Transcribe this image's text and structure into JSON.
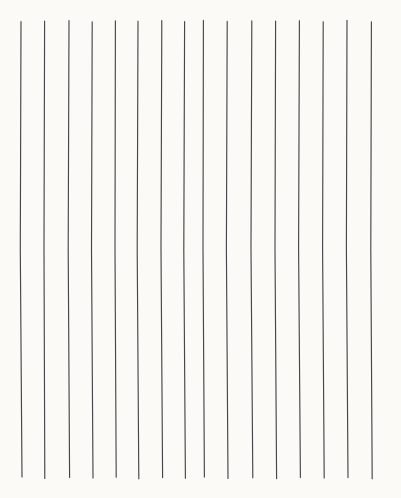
{
  "artwork": {
    "title": "Vertical Lines",
    "description": "Sixteen hand-drawn near-vertical lines on off-white paper",
    "medium": "pen-on-paper",
    "canvas": {
      "width": 401,
      "height": 498,
      "background_color": "#fbfaf7",
      "border_color": "#ffffff"
    },
    "stroke": {
      "color": "#3c3c3e",
      "width": 1.15,
      "linecap": "round",
      "opacity": 0.95
    },
    "line_count": 16,
    "extent": {
      "x_first": 21,
      "x_last": 372,
      "y_top": 20,
      "y_bottom": 478,
      "mean_spacing": 23.4
    },
    "lines": [
      {
        "id": 1,
        "x_top": 21.0,
        "x_mid": 20.3,
        "x_bottom": 22.0,
        "y_top": 21.5,
        "y_bottom": 477.0,
        "wobble": -0.7
      },
      {
        "id": 2,
        "x_top": 44.6,
        "x_mid": 44.0,
        "x_bottom": 44.8,
        "y_top": 21.0,
        "y_bottom": 478.5,
        "wobble": -0.5
      },
      {
        "id": 3,
        "x_top": 69.0,
        "x_mid": 68.2,
        "x_bottom": 69.6,
        "y_top": 20.5,
        "y_bottom": 477.5,
        "wobble": -0.8
      },
      {
        "id": 4,
        "x_top": 92.2,
        "x_mid": 91.5,
        "x_bottom": 93.0,
        "y_top": 21.8,
        "y_bottom": 478.0,
        "wobble": -0.6
      },
      {
        "id": 5,
        "x_top": 115.4,
        "x_mid": 115.0,
        "x_bottom": 116.2,
        "y_top": 20.8,
        "y_bottom": 477.2,
        "wobble": -0.4
      },
      {
        "id": 6,
        "x_top": 138.0,
        "x_mid": 137.2,
        "x_bottom": 138.8,
        "y_top": 21.2,
        "y_bottom": 478.8,
        "wobble": -0.7
      },
      {
        "id": 7,
        "x_top": 161.8,
        "x_mid": 161.0,
        "x_bottom": 162.6,
        "y_top": 20.6,
        "y_bottom": 477.6,
        "wobble": -0.8
      },
      {
        "id": 8,
        "x_top": 184.6,
        "x_mid": 183.8,
        "x_bottom": 185.4,
        "y_top": 21.6,
        "y_bottom": 478.2,
        "wobble": -0.6
      },
      {
        "id": 9,
        "x_top": 203.4,
        "x_mid": 203.0,
        "x_bottom": 204.4,
        "y_top": 20.4,
        "y_bottom": 477.0,
        "wobble": -0.4
      },
      {
        "id": 10,
        "x_top": 227.2,
        "x_mid": 226.4,
        "x_bottom": 228.0,
        "y_top": 21.4,
        "y_bottom": 478.4,
        "wobble": -0.7
      },
      {
        "id": 11,
        "x_top": 251.8,
        "x_mid": 251.0,
        "x_bottom": 252.8,
        "y_top": 20.9,
        "y_bottom": 477.8,
        "wobble": -0.8
      },
      {
        "id": 12,
        "x_top": 275.6,
        "x_mid": 275.0,
        "x_bottom": 276.6,
        "y_top": 21.1,
        "y_bottom": 478.6,
        "wobble": -0.5
      },
      {
        "id": 13,
        "x_top": 299.4,
        "x_mid": 298.6,
        "x_bottom": 300.4,
        "y_top": 20.7,
        "y_bottom": 477.4,
        "wobble": -0.8
      },
      {
        "id": 14,
        "x_top": 323.2,
        "x_mid": 322.6,
        "x_bottom": 324.2,
        "y_top": 21.7,
        "y_bottom": 478.0,
        "wobble": -0.6
      },
      {
        "id": 15,
        "x_top": 347.0,
        "x_mid": 346.4,
        "x_bottom": 348.0,
        "y_top": 20.3,
        "y_bottom": 477.6,
        "wobble": -0.6
      },
      {
        "id": 16,
        "x_top": 371.4,
        "x_mid": 370.8,
        "x_bottom": 372.2,
        "y_top": 21.9,
        "y_bottom": 478.8,
        "wobble": -0.5
      }
    ]
  }
}
